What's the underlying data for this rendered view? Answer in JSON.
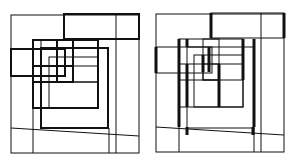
{
  "colors": {
    "background": "#ffffff",
    "stroke": "#111111"
  },
  "figures": [
    {
      "id": "left",
      "offset_x": 0,
      "description": "Nested overlapping rectangles, uniform line weights",
      "rects": [
        {
          "x": 11,
          "y": 15,
          "w": 128,
          "h": 138,
          "sw": 1
        },
        {
          "x": 64,
          "y": 14,
          "w": 75,
          "h": 25,
          "sw": 2
        },
        {
          "x": 11,
          "y": 49,
          "w": 54,
          "h": 27,
          "sw": 2
        },
        {
          "x": 33,
          "y": 40,
          "w": 65,
          "h": 68,
          "sw": 2
        },
        {
          "x": 41,
          "y": 48,
          "w": 67,
          "h": 80,
          "sw": 2
        },
        {
          "x": 33,
          "y": 66,
          "w": 40,
          "h": 16,
          "sw": 2
        },
        {
          "x": 57,
          "y": 40,
          "w": 16,
          "h": 42,
          "sw": 2
        },
        {
          "x": 57,
          "y": 66,
          "w": 41,
          "h": 16,
          "sw": 1
        },
        {
          "x": 49,
          "y": 57,
          "w": 49,
          "h": 51,
          "sw": 1
        }
      ],
      "lines": [
        {
          "x1": 116,
          "y1": 14,
          "x2": 116,
          "y2": 153,
          "sw": 1
        },
        {
          "x1": 11,
          "y1": 128,
          "x2": 139,
          "y2": 136,
          "sw": 1
        },
        {
          "x1": 33,
          "y1": 108,
          "x2": 33,
          "y2": 153,
          "sw": 1
        },
        {
          "x1": 109,
          "y1": 128,
          "x2": 109,
          "y2": 153,
          "sw": 1
        },
        {
          "x1": 41,
          "y1": 40,
          "x2": 41,
          "y2": 108,
          "sw": 1
        },
        {
          "x1": 73,
          "y1": 82,
          "x2": 98,
          "y2": 82,
          "sw": 1
        }
      ]
    },
    {
      "id": "right",
      "offset_x": 145,
      "description": "Same nested rectangles with selected vertical segments emphasized",
      "rects": [
        {
          "x": 11,
          "y": 14,
          "w": 128,
          "h": 138,
          "sw": 1
        },
        {
          "x": 66,
          "y": 13,
          "w": 73,
          "h": 25,
          "sw": 1
        },
        {
          "x": 11,
          "y": 47,
          "w": 56,
          "h": 26,
          "sw": 1
        },
        {
          "x": 34,
          "y": 39,
          "w": 64,
          "h": 68,
          "sw": 1
        },
        {
          "x": 42,
          "y": 47,
          "w": 67,
          "h": 81,
          "sw": 1
        },
        {
          "x": 34,
          "y": 64,
          "w": 40,
          "h": 16,
          "sw": 1
        },
        {
          "x": 58,
          "y": 39,
          "w": 16,
          "h": 41,
          "sw": 1
        },
        {
          "x": 58,
          "y": 64,
          "w": 40,
          "h": 16,
          "sw": 1
        },
        {
          "x": 49,
          "y": 55,
          "w": 49,
          "h": 52,
          "sw": 1
        }
      ],
      "lines": [
        {
          "x1": 116,
          "y1": 13,
          "x2": 116,
          "y2": 152,
          "sw": 1
        },
        {
          "x1": 11,
          "y1": 127,
          "x2": 139,
          "y2": 135,
          "sw": 1
        },
        {
          "x1": 34,
          "y1": 107,
          "x2": 34,
          "y2": 152,
          "sw": 1
        },
        {
          "x1": 109,
          "y1": 128,
          "x2": 109,
          "y2": 152,
          "sw": 1
        },
        {
          "x1": 66,
          "y1": 13,
          "x2": 66,
          "y2": 38,
          "sw": 3
        },
        {
          "x1": 139,
          "y1": 13,
          "x2": 139,
          "y2": 38,
          "sw": 3
        },
        {
          "x1": 11,
          "y1": 47,
          "x2": 11,
          "y2": 73,
          "sw": 3
        },
        {
          "x1": 34,
          "y1": 39,
          "x2": 34,
          "y2": 127,
          "sw": 3
        },
        {
          "x1": 42,
          "y1": 39,
          "x2": 42,
          "y2": 47,
          "sw": 3
        },
        {
          "x1": 42,
          "y1": 64,
          "x2": 42,
          "y2": 107,
          "sw": 3
        },
        {
          "x1": 42,
          "y1": 127,
          "x2": 42,
          "y2": 135,
          "sw": 3
        },
        {
          "x1": 58,
          "y1": 55,
          "x2": 58,
          "y2": 72,
          "sw": 3
        },
        {
          "x1": 64,
          "y1": 47,
          "x2": 64,
          "y2": 72,
          "sw": 3
        },
        {
          "x1": 74,
          "y1": 64,
          "x2": 74,
          "y2": 107,
          "sw": 3
        },
        {
          "x1": 98,
          "y1": 39,
          "x2": 98,
          "y2": 80,
          "sw": 3
        },
        {
          "x1": 109,
          "y1": 39,
          "x2": 109,
          "y2": 127,
          "sw": 3
        },
        {
          "x1": 108,
          "y1": 127,
          "x2": 108,
          "y2": 135,
          "sw": 3
        }
      ]
    }
  ]
}
